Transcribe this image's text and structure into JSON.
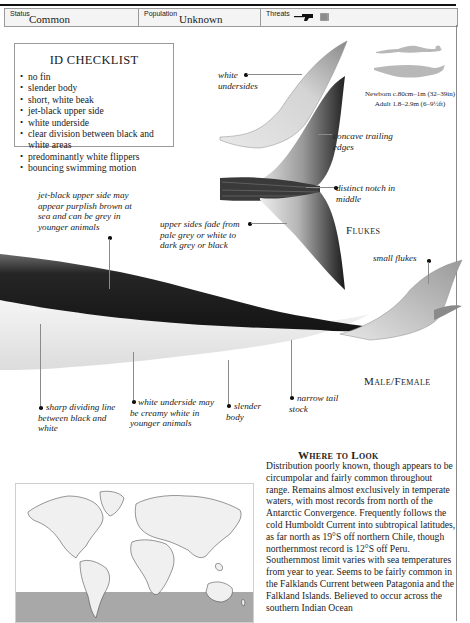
{
  "status_bar": {
    "status": {
      "label": "Status",
      "value": "Common"
    },
    "population": {
      "label": "Population",
      "value": "Unknown"
    },
    "threats": {
      "label": "Threats",
      "icons": [
        "harpoon-gun-icon",
        "fishing-net-icon"
      ]
    }
  },
  "id_checklist": {
    "title": "ID CHECKLIST",
    "items": [
      "no fin",
      "slender body",
      "short, white beak",
      "jet-black upper side",
      "white underside",
      "clear division between black and white areas",
      "predominantly white flippers",
      "bouncing swimming motion"
    ]
  },
  "size_comparison": {
    "icons": [
      "human-silhouette-icon",
      "whale-silhouette-icon"
    ],
    "newborn": "Newborn c.80cm–1m (32–39in)",
    "adult": "Adult 1.8–2.9m (6–9½ft)"
  },
  "flukes": {
    "label": "Flukes",
    "annotations": {
      "white_undersides": "white undersides",
      "concave_trailing_edges": "concave trailing edges",
      "distinct_notch": "distinct notch in middle",
      "upper_sides_fade": "upper sides fade from pale grey or white to dark grey or black"
    }
  },
  "body": {
    "label": "Male/Female",
    "annotations": {
      "jet_black_upper": "jet-black upper side may appear purplish brown at sea and can be grey in younger animals",
      "small_flukes": "small flukes",
      "sharp_dividing_line": "sharp dividing line between black and white",
      "white_underside": "white underside may be creamy white in younger animals",
      "slender_body": "slender body",
      "narrow_tail_stock": "narrow tail stock"
    }
  },
  "where_to_look": {
    "title": "Where to Look",
    "body": "Distribution poorly known, though appears to be circumpolar and fairly common throughout range. Remains almost exclusively in temperate waters, with most records from north of the Antarctic Convergence. Frequently follows the cold Humboldt Current into subtropical latitudes, as far north as 19°S off northern Chile, though northernmost record is 12°S off Peru. Southernmost limit varies with sea temperatures from year to year. Seems to be fairly common in the Falklands Current between Patagonia and the Falkland Islands. Believed to occur across the southern Indian Ocean"
  },
  "range_map": {
    "description": "World map with southern hemisphere temperate range shaded",
    "land_color": "#f0f0f0",
    "range_color": "#a8a8a8"
  }
}
